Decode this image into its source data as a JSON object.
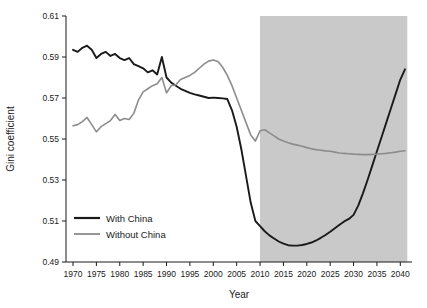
{
  "chart_data": {
    "type": "line",
    "title": "",
    "xlabel": "Year",
    "ylabel": "Gini coefficient",
    "xlim": [
      1968.5,
      1968.5
    ],
    "ylim": [
      0.49,
      0.61
    ],
    "xticks": [
      1970,
      1975,
      1980,
      1985,
      1990,
      1995,
      2000,
      2005,
      2010,
      2015,
      2020,
      2025,
      2030,
      2035,
      2040
    ],
    "xtick_labels": [
      "1970",
      "1975",
      "1980",
      "1985",
      "1990",
      "1995",
      "2000",
      "2005",
      "2010",
      "2015",
      "2020",
      "2025",
      "2030",
      "2035",
      "2040"
    ],
    "yticks": [
      0.49,
      0.51,
      0.53,
      0.55,
      0.57,
      0.59,
      0.61
    ],
    "ytick_labels": [
      "0.49",
      "0.51",
      "0.53",
      "0.55",
      "0.57",
      "0.59",
      "0.61"
    ],
    "grid": false,
    "legend_position": "lower-left-inside",
    "shaded_region": {
      "label": "projection",
      "x_start": 2010,
      "x_end": 2041.5,
      "color": "#c9c9c9"
    },
    "series": [
      {
        "name": "With China",
        "color": "#1a1a1a",
        "x": [
          1970,
          1971,
          1972,
          1973,
          1974,
          1975,
          1976,
          1977,
          1978,
          1979,
          1980,
          1981,
          1982,
          1983,
          1984,
          1985,
          1986,
          1987,
          1988,
          1989,
          1990,
          1991,
          1992,
          1993,
          1994,
          1995,
          1996,
          1997,
          1998,
          1999,
          2000,
          2001,
          2002,
          2003,
          2004,
          2005,
          2006,
          2007,
          2008,
          2009,
          2010,
          2011,
          2012,
          2013,
          2014,
          2015,
          2016,
          2017,
          2018,
          2019,
          2020,
          2021,
          2022,
          2023,
          2024,
          2025,
          2026,
          2027,
          2028,
          2029,
          2030,
          2031,
          2032,
          2033,
          2034,
          2035,
          2036,
          2037,
          2038,
          2039,
          2040,
          2041
        ],
        "y": [
          0.5935,
          0.5925,
          0.5945,
          0.5955,
          0.5935,
          0.5895,
          0.5915,
          0.5925,
          0.5905,
          0.5915,
          0.5895,
          0.5885,
          0.5895,
          0.5865,
          0.5855,
          0.5845,
          0.5825,
          0.5835,
          0.5815,
          0.59,
          0.58,
          0.5775,
          0.576,
          0.5745,
          0.5735,
          0.5725,
          0.5718,
          0.5712,
          0.5706,
          0.57,
          0.5702,
          0.57,
          0.5698,
          0.5695,
          0.564,
          0.556,
          0.545,
          0.532,
          0.519,
          0.51,
          0.5075,
          0.505,
          0.503,
          0.5015,
          0.5,
          0.499,
          0.4982,
          0.498,
          0.498,
          0.4983,
          0.4988,
          0.4995,
          0.5005,
          0.5018,
          0.5032,
          0.5048,
          0.5065,
          0.5082,
          0.5098,
          0.511,
          0.513,
          0.5175,
          0.5235,
          0.53,
          0.537,
          0.544,
          0.551,
          0.558,
          0.565,
          0.572,
          0.579,
          0.584
        ]
      },
      {
        "name": "Without China",
        "color": "#8c8c8c",
        "x": [
          1970,
          1971,
          1972,
          1973,
          1974,
          1975,
          1976,
          1977,
          1978,
          1979,
          1980,
          1981,
          1982,
          1983,
          1984,
          1985,
          1986,
          1987,
          1988,
          1989,
          1990,
          1991,
          1992,
          1993,
          1994,
          1995,
          1996,
          1997,
          1998,
          1999,
          2000,
          2001,
          2002,
          2003,
          2004,
          2005,
          2006,
          2007,
          2008,
          2009,
          2010,
          2011,
          2012,
          2013,
          2014,
          2015,
          2016,
          2017,
          2018,
          2019,
          2020,
          2021,
          2022,
          2023,
          2024,
          2025,
          2026,
          2027,
          2028,
          2029,
          2030,
          2031,
          2032,
          2033,
          2034,
          2035,
          2036,
          2037,
          2038,
          2039,
          2040,
          2041
        ],
        "y": [
          0.5565,
          0.557,
          0.5585,
          0.5605,
          0.557,
          0.5535,
          0.556,
          0.5575,
          0.559,
          0.562,
          0.559,
          0.56,
          0.5595,
          0.5625,
          0.569,
          0.573,
          0.5745,
          0.576,
          0.577,
          0.58,
          0.5725,
          0.576,
          0.5765,
          0.579,
          0.58,
          0.581,
          0.5825,
          0.5845,
          0.5865,
          0.588,
          0.5885,
          0.5878,
          0.585,
          0.581,
          0.576,
          0.57,
          0.564,
          0.558,
          0.552,
          0.549,
          0.554,
          0.5545,
          0.553,
          0.5515,
          0.55,
          0.549,
          0.5482,
          0.5475,
          0.547,
          0.5465,
          0.5458,
          0.5452,
          0.5448,
          0.5445,
          0.5442,
          0.544,
          0.5436,
          0.5432,
          0.543,
          0.5428,
          0.5426,
          0.5425,
          0.5424,
          0.5424,
          0.5425,
          0.5426,
          0.5428,
          0.543,
          0.5433,
          0.5436,
          0.544,
          0.5443
        ]
      }
    ]
  },
  "legend": {
    "items": [
      {
        "label": "With China",
        "color": "#1a1a1a"
      },
      {
        "label": "Without China",
        "color": "#8c8c8c"
      }
    ]
  },
  "axes": {
    "x_title": "Year",
    "y_title": "Gini coefficient"
  }
}
